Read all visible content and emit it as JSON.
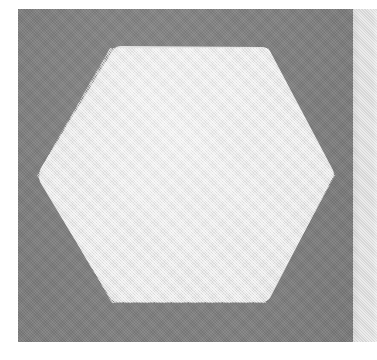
{
  "figure": {
    "title": "Hexagon on gray background",
    "canvas": {
      "width": 377,
      "height": 360,
      "background_color": "#ffffff"
    },
    "panel": {
      "name": "gray-background-panel",
      "fill_color": "#808080",
      "x": 18,
      "y": 9,
      "width": 335,
      "height": 333
    },
    "right_strip": {
      "name": "light-vertical-strip",
      "fill_color": "#dedede",
      "x": 353,
      "y": 9,
      "width": 24,
      "height": 333
    },
    "shape": {
      "name": "hexagon",
      "type": "hexagon",
      "sides": 6,
      "orientation": "flat-top",
      "fill_color": "#e4e4e4",
      "stroke": "none",
      "corner_radius": 6,
      "center_x": 186,
      "center_y": 176,
      "width": 298,
      "height": 255,
      "vertices": [
        {
          "label": "left",
          "x": 37,
          "y": 175
        },
        {
          "label": "top-left",
          "x": 110,
          "y": 48
        },
        {
          "label": "top-right",
          "x": 268,
          "y": 48
        },
        {
          "label": "right",
          "x": 335,
          "y": 175
        },
        {
          "label": "bottom-right",
          "x": 266,
          "y": 303
        },
        {
          "label": "bottom-left",
          "x": 112,
          "y": 303
        }
      ]
    },
    "margins": {
      "left": 18,
      "top": 9,
      "right": 0,
      "bottom": 18,
      "color": "#ffffff"
    }
  }
}
